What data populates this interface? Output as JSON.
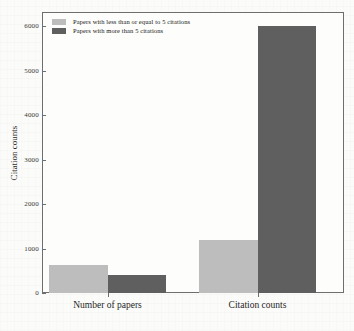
{
  "chart_data": {
    "type": "bar",
    "title": "",
    "subtitle": "",
    "xlabel": "",
    "ylabel": "Citation counts",
    "categories": [
      "Number of papers",
      "Citation counts"
    ],
    "series": [
      {
        "name": "Papers with less than or equal to 5 citations",
        "color": "#bdbdbd",
        "values": [
          620,
          1200
        ]
      },
      {
        "name": "Papers with more than 5 citations",
        "color": "#5f5f5f",
        "values": [
          410,
          6000
        ]
      }
    ],
    "ylim": [
      0,
      6300
    ],
    "yticks": [
      0,
      1000,
      2000,
      3000,
      4000,
      5000,
      6000
    ],
    "ytick_labels": [
      "0",
      "1000",
      "2000",
      "3000",
      "4000",
      "5000",
      "6000"
    ],
    "grid": false,
    "legend_position": "top-left",
    "frame": true
  },
  "legend": {
    "entries": [
      {
        "label": "Papers with less than or equal to 5 citations",
        "color": "#bdbdbd"
      },
      {
        "label": "Papers with more than 5 citations",
        "color": "#5f5f5f"
      }
    ]
  },
  "axes": {
    "y_title": "Citation counts",
    "x_categories": [
      "Number of papers",
      "Citation counts"
    ]
  },
  "colors": {
    "series_light": "#bdbdbd",
    "series_dark": "#5f5f5f",
    "axis": "#6e6e6e",
    "text": "#1f1f1f",
    "background": "#fbfbfa"
  }
}
